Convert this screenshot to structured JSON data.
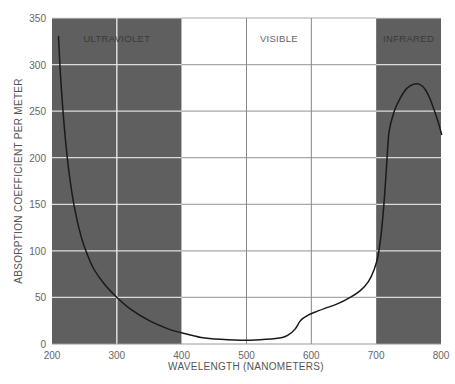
{
  "chart_data": {
    "type": "line",
    "title": "",
    "xlabel": "WAVELENGTH (NANOMETERS)",
    "ylabel": "ABSORPTION COEFFICIENT PER METER",
    "xlim": [
      200,
      800
    ],
    "ylim": [
      0,
      350
    ],
    "x_ticks": [
      200,
      300,
      400,
      500,
      600,
      700,
      800
    ],
    "y_ticks": [
      0,
      50,
      100,
      150,
      200,
      250,
      300,
      350
    ],
    "grid": true,
    "legend": null,
    "regions": [
      {
        "label": "ULTRAVIOLET",
        "from": 200,
        "to": 400,
        "shade": "#5f5f5f",
        "label_color": "#3a3a3a"
      },
      {
        "label": "VISIBLE",
        "from": 400,
        "to": 700,
        "shade": "#ffffff",
        "label_color": "#666666"
      },
      {
        "label": "INFRARED",
        "from": 700,
        "to": 800,
        "shade": "#5f5f5f",
        "label_color": "#3a3a3a"
      }
    ],
    "series": [
      {
        "name": "absorption",
        "color": "#1a1a1a",
        "x": [
          210,
          213,
          217,
          222,
          228,
          235,
          245,
          255,
          265,
          280,
          300,
          320,
          350,
          380,
          400,
          430,
          460,
          500,
          530,
          555,
          565,
          575,
          582,
          588,
          595,
          605,
          620,
          640,
          660,
          675,
          688,
          697,
          703,
          708,
          712,
          716,
          720,
          728,
          738,
          748,
          758,
          766,
          774,
          782,
          790,
          797,
          801
        ],
        "y": [
          330,
          290,
          250,
          210,
          175,
          145,
          115,
          95,
          80,
          65,
          50,
          38,
          25,
          16,
          12,
          7,
          5,
          4,
          5,
          7,
          10,
          16,
          24,
          28,
          31,
          34,
          38,
          43,
          50,
          57,
          67,
          80,
          95,
          120,
          150,
          190,
          228,
          250,
          265,
          275,
          279,
          279,
          275,
          265,
          250,
          235,
          225
        ]
      }
    ]
  }
}
